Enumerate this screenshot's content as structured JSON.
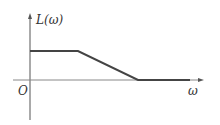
{
  "diagram": {
    "type": "bode-magnitude-asymptote",
    "y_axis_label": "L(ω)",
    "x_axis_label": "ω",
    "origin_label": "O",
    "segments": [
      {
        "name": "flat-low",
        "from": [
          30,
          51
        ],
        "to": [
          78,
          51
        ]
      },
      {
        "name": "slope-down",
        "from": [
          78,
          51
        ],
        "to": [
          138,
          80
        ]
      },
      {
        "name": "flat-zero",
        "from": [
          138,
          80
        ],
        "to": [
          190,
          80
        ]
      }
    ],
    "colors": {
      "axis": "#555555",
      "curve": "#444444",
      "text": "#333333"
    }
  }
}
